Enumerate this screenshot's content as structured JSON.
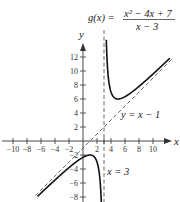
{
  "chart_data": {
    "type": "line",
    "title": "",
    "function_label": {
      "lhs": "g(x) =",
      "numerator": "x² − 4x + 7",
      "denominator": "x − 3"
    },
    "xlabel": "x",
    "ylabel": "y",
    "xlim": [
      -11.5,
      13
    ],
    "ylim": [
      -8,
      13.5
    ],
    "x_ticks": [
      -10,
      -8,
      -6,
      -4,
      -2,
      2,
      4,
      6,
      8,
      10
    ],
    "x_tick_labels": [
      "−10",
      "−8",
      "−6",
      "−4",
      "−2",
      "2",
      "4",
      "6",
      "8",
      "10"
    ],
    "y_ticks": [
      12,
      10,
      8,
      6,
      4,
      2,
      -2,
      -4,
      -6,
      -8
    ],
    "y_tick_labels": [
      "12",
      "10",
      "8",
      "6",
      "4",
      "2",
      "−2",
      "−4",
      "−6",
      "−8"
    ],
    "grid": false,
    "series": [
      {
        "name": "g(x) left branch",
        "style": "solid",
        "x": [
          -6.5,
          -5,
          -4,
          -3,
          -2,
          -1,
          0,
          1,
          2,
          2.5,
          2.8
        ],
        "y": [
          -7.9,
          -6.5,
          -5.86,
          -5.33,
          -4.8,
          -4.25,
          -2.33,
          -2,
          -3,
          -4.5,
          -9.2
        ]
      },
      {
        "name": "g(x) right branch",
        "style": "solid",
        "x": [
          3.35,
          3.5,
          4,
          5,
          6,
          8,
          10,
          12.4
        ],
        "y": [
          13.5,
          10.5,
          7,
          6,
          6.33,
          7.8,
          9.57,
          11.8
        ]
      },
      {
        "name": "oblique asymptote",
        "style": "dashed",
        "label": "y = x − 1"
      },
      {
        "name": "vertical asymptote",
        "style": "dashed",
        "label": "x = 3"
      }
    ],
    "annotations": {
      "oblique": "y = x − 1",
      "vertical": "x = 3"
    }
  },
  "labels": {
    "y_axis": "y",
    "x_axis": "x",
    "g_lhs": "g(x) =",
    "g_num": "x² − 4x + 7",
    "g_den": "x − 3",
    "oblique_eq": "y = x − 1",
    "vertical_eq": "x = 3"
  }
}
